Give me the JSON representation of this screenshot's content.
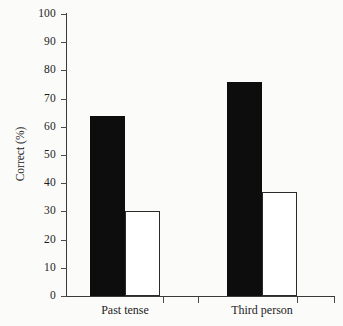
{
  "chart_data": {
    "type": "bar",
    "title": "",
    "xlabel": "",
    "ylabel": "Correct (%)",
    "ylim": [
      0,
      100
    ],
    "ytick_step": 10,
    "yticks": [
      0,
      10,
      20,
      30,
      40,
      50,
      60,
      70,
      80,
      90,
      100
    ],
    "grid": false,
    "legend": "none",
    "categories": [
      "Past tense",
      "Third person"
    ],
    "series": [
      {
        "name": "filled-bar",
        "style": "black filled",
        "values": [
          64,
          76
        ]
      },
      {
        "name": "open-bar",
        "style": "white outlined",
        "values": [
          30,
          37
        ]
      }
    ],
    "colors": {
      "filled_bar": "#0d0d0d",
      "open_bar_fill": "#ffffff",
      "open_bar_stroke": "#2b2b2b",
      "axis": "#3a3a3a",
      "text": "#1d1d1d",
      "background": "#fbfbfa"
    }
  },
  "axis": {
    "y_title": "Correct (%)",
    "tick_labels": [
      "100",
      "90",
      "80",
      "70",
      "60",
      "50",
      "40",
      "30",
      "20",
      "10",
      "0"
    ]
  },
  "categories": [
    {
      "label": "Past tense"
    },
    {
      "label": "Third person"
    }
  ]
}
